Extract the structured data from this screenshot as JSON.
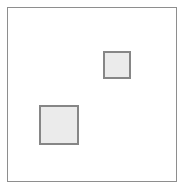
{
  "canvas": {
    "width": 184,
    "height": 191,
    "background_color": "#ffffff",
    "title": "",
    "frame": {
      "name": "outer-frame",
      "x": 7,
      "y": 7,
      "width": 170,
      "height": 175,
      "border_color": "#8e8e8e",
      "border_width": 1,
      "fill_color": "#ffffff",
      "label": ""
    }
  },
  "shapes": [
    {
      "id": "square-small",
      "type": "square",
      "label": "",
      "x": 103,
      "y": 51,
      "width": 28,
      "height": 28,
      "fill_color": "#ebebeb",
      "border_color": "#868686",
      "border_width": 2
    },
    {
      "id": "square-large",
      "type": "square",
      "label": "",
      "x": 39,
      "y": 105,
      "width": 40,
      "height": 40,
      "fill_color": "#ebebeb",
      "border_color": "#868686",
      "border_width": 2
    }
  ],
  "annotations": {
    "shape_count": 2,
    "caption": ""
  }
}
